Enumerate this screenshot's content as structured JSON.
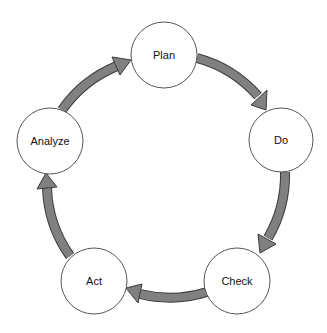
{
  "diagram": {
    "type": "cycle",
    "colors": {
      "background": "#ffffff",
      "node_fill": "#ffffff",
      "node_stroke": "#555555",
      "arrow_fill": "#808080",
      "arrow_outline": "#3a3a3a",
      "label": "#111111"
    },
    "nodes": [
      {
        "id": "plan",
        "label": "Plan"
      },
      {
        "id": "do",
        "label": "Do"
      },
      {
        "id": "check",
        "label": "Check"
      },
      {
        "id": "act",
        "label": "Act"
      },
      {
        "id": "analyze",
        "label": "Analyze"
      }
    ],
    "edges": [
      {
        "from": "Plan",
        "to": "Do"
      },
      {
        "from": "Do",
        "to": "Check"
      },
      {
        "from": "Check",
        "to": "Act"
      },
      {
        "from": "Act",
        "to": "Analyze"
      },
      {
        "from": "Analyze",
        "to": "Plan"
      }
    ]
  }
}
